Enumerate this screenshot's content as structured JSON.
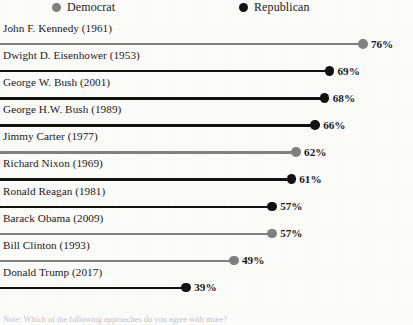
{
  "legend": {
    "entries": [
      {
        "label": "Democrat",
        "color": "#808080",
        "icon": "circle-icon"
      },
      {
        "label": "Republican",
        "color": "#121212",
        "icon": "circle-icon"
      }
    ]
  },
  "footnote": {
    "text": "Note: Which of the following approaches do you agree with more?"
  },
  "colors": {
    "democrat": "#808080",
    "republican": "#121212",
    "background": "#fbfbfa",
    "text": "#1a1a1a"
  },
  "chart_data": {
    "type": "bar",
    "title": "",
    "subtitle": "",
    "xlabel": "",
    "ylabel": "",
    "xlim": [
      0,
      80
    ],
    "grid": false,
    "legend_position": "top",
    "legend": [
      "Democrat",
      "Republican"
    ],
    "categories": [
      "John F. Kennedy (1961)",
      "Dwight D. Eisenhower (1953)",
      "George W. Bush (2001)",
      "George H.W. Bush (1989)",
      "Jimmy Carter (1977)",
      "Richard Nixon (1969)",
      "Ronald Reagan (1981)",
      "Barack Obama (2009)",
      "Bill Clinton (1993)",
      "Donald Trump (2017)"
    ],
    "values": [
      76,
      69,
      68,
      66,
      62,
      61,
      57,
      57,
      49,
      39
    ],
    "value_labels": [
      "76%",
      "69%",
      "68%",
      "66%",
      "62%",
      "61%",
      "57%",
      "57%",
      "49%",
      "39%"
    ],
    "parties": [
      "Democrat",
      "Republican",
      "Republican",
      "Republican",
      "Democrat",
      "Republican",
      "Republican",
      "Democrat",
      "Democrat",
      "Republican"
    ],
    "rows": [
      {
        "label": "John F. Kennedy (1961)",
        "value": 76,
        "value_label": "76%",
        "party": "Democrat",
        "color": "#808080"
      },
      {
        "label": "Dwight D. Eisenhower (1953)",
        "value": 69,
        "value_label": "69%",
        "party": "Republican",
        "color": "#121212"
      },
      {
        "label": "George W. Bush (2001)",
        "value": 68,
        "value_label": "68%",
        "party": "Republican",
        "color": "#121212"
      },
      {
        "label": "George H.W. Bush (1989)",
        "value": 66,
        "value_label": "66%",
        "party": "Republican",
        "color": "#121212"
      },
      {
        "label": "Jimmy Carter (1977)",
        "value": 62,
        "value_label": "62%",
        "party": "Democrat",
        "color": "#808080"
      },
      {
        "label": "Richard Nixon (1969)",
        "value": 61,
        "value_label": "61%",
        "party": "Republican",
        "color": "#121212"
      },
      {
        "label": "Ronald Reagan (1981)",
        "value": 57,
        "value_label": "57%",
        "party": "Republican",
        "color": "#121212"
      },
      {
        "label": "Barack Obama (2009)",
        "value": 57,
        "value_label": "57%",
        "party": "Democrat",
        "color": "#808080"
      },
      {
        "label": "Bill Clinton (1993)",
        "value": 49,
        "value_label": "49%",
        "party": "Democrat",
        "color": "#808080"
      },
      {
        "label": "Donald Trump (2017)",
        "value": 39,
        "value_label": "39%",
        "party": "Republican",
        "color": "#121212"
      }
    ]
  }
}
